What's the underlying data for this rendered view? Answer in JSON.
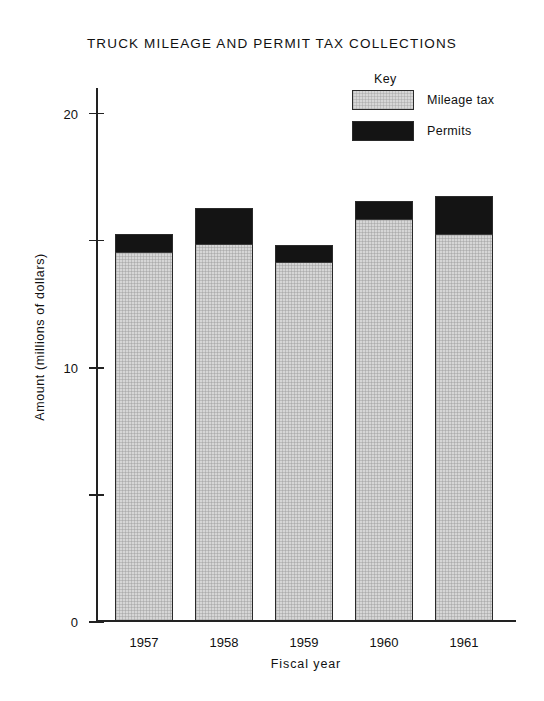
{
  "chart_data": {
    "type": "bar",
    "title": "TRUCK MILEAGE AND PERMIT TAX COLLECTIONS",
    "xlabel": "Fiscal year",
    "ylabel": "Amount (millions of dollars)",
    "categories": [
      "1957",
      "1958",
      "1959",
      "1960",
      "1961"
    ],
    "series": [
      {
        "name": "Mileage tax",
        "color": "#d6d6d6",
        "values": [
          14.5,
          14.8,
          14.1,
          15.8,
          15.2
        ]
      },
      {
        "name": "Permits",
        "color": "#141414",
        "values": [
          0.7,
          1.4,
          0.65,
          0.7,
          1.5
        ]
      }
    ],
    "totals": [
      15.2,
      16.2,
      14.75,
      16.5,
      16.7
    ],
    "stacked": true,
    "ylim": [
      0,
      21
    ],
    "y_major_ticks": [
      0,
      10,
      20
    ],
    "y_minor_ticks": [
      5,
      15
    ],
    "y_tick_labels": [
      "0",
      "10",
      "20"
    ],
    "grid": false,
    "legend_title": "Key",
    "legend_position": "top-right"
  },
  "legend": {
    "title": "Key",
    "entries": [
      {
        "label": "Mileage tax",
        "swatch": "light-gray"
      },
      {
        "label": "Permits",
        "swatch": "black"
      }
    ]
  }
}
